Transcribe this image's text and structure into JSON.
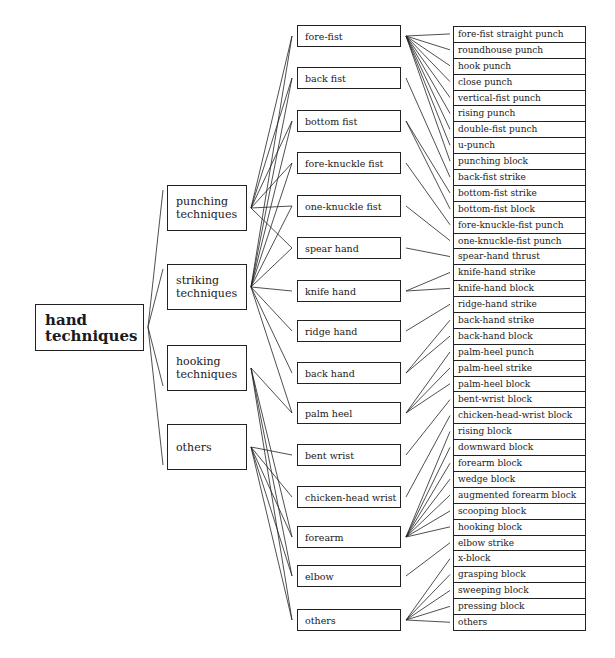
{
  "diagram": {
    "root": {
      "label_line1": "hand",
      "label_line2": "techniques"
    },
    "categories": [
      {
        "line1": "punching",
        "line2": "techniques",
        "top": 185
      },
      {
        "line1": "striking",
        "line2": "techniques",
        "top": 264
      },
      {
        "line1": "hooking",
        "line2": "techniques",
        "top": 345
      },
      {
        "line1": "others",
        "line2": "",
        "top": 424
      }
    ],
    "hand_parts": [
      {
        "label": "fore-fist",
        "top": 25
      },
      {
        "label": "back fist",
        "top": 67
      },
      {
        "label": "bottom fist",
        "top": 110
      },
      {
        "label": "fore-knuckle fist",
        "top": 152
      },
      {
        "label": "one-knuckle fist",
        "top": 195
      },
      {
        "label": "spear hand",
        "top": 237
      },
      {
        "label": "knife hand",
        "top": 280
      },
      {
        "label": "ridge hand",
        "top": 320
      },
      {
        "label": "back hand",
        "top": 362
      },
      {
        "label": "palm heel",
        "top": 402
      },
      {
        "label": "bent wrist",
        "top": 444
      },
      {
        "label": "chicken-head wrist",
        "top": 486
      },
      {
        "label": "forearm",
        "top": 526
      },
      {
        "label": "elbow",
        "top": 565
      },
      {
        "label": "others",
        "top": 609
      }
    ],
    "techniques": [
      "fore-fist straight punch",
      "roundhouse punch",
      "hook punch",
      "close punch",
      "vertical-fist punch",
      "rising punch",
      "double-fist punch",
      "u-punch",
      "punching block",
      "back-fist strike",
      "bottom-fist strike",
      "bottom-fist block",
      "fore-knuckle-fist punch",
      "one-knuckle-fist punch",
      "spear-hand thrust",
      "knife-hand strike",
      "knife-hand block",
      "ridge-hand strike",
      "back-hand strike",
      "back-hand block",
      "palm-heel punch",
      "palm-heel strike",
      "palm-heel block",
      "bent-wrist block",
      "chicken-head-wrist block",
      "rising block",
      "downward block",
      "forearm block",
      "wedge block",
      "augmented forearm block",
      "scooping block",
      "hooking block",
      "elbow strike",
      "x-block",
      "grasping block",
      "sweeping block",
      "pressing block",
      "others"
    ],
    "category_to_parts": {
      "punching": [
        0,
        1,
        2,
        3,
        4,
        5
      ],
      "striking": [
        0,
        1,
        2,
        3,
        4,
        5,
        6,
        7,
        8,
        9
      ],
      "hooking": [
        9,
        12,
        13,
        14
      ],
      "others": [
        10,
        11,
        12,
        13,
        14
      ]
    },
    "part_to_techniques": {
      "0": [
        0,
        1,
        2,
        3,
        4,
        5,
        6,
        7,
        8
      ],
      "1": [
        9
      ],
      "2": [
        10,
        11
      ],
      "3": [
        12
      ],
      "4": [
        13
      ],
      "5": [
        14
      ],
      "6": [
        15,
        16
      ],
      "7": [
        17
      ],
      "8": [
        18,
        19
      ],
      "9": [
        20,
        21,
        22
      ],
      "10": [
        23
      ],
      "11": [
        24
      ],
      "12": [
        25,
        26,
        27,
        28,
        29,
        30,
        31
      ],
      "13": [
        32
      ],
      "14": [
        33,
        34,
        35,
        36,
        37
      ]
    }
  }
}
